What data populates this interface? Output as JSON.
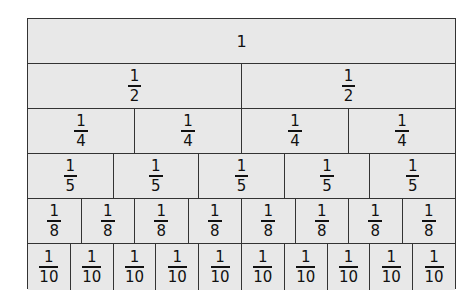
{
  "diagram": {
    "rows": [
      {
        "denominator": 1,
        "label": "1",
        "count": 1
      },
      {
        "denominator": 2,
        "numerator": "1",
        "den_label": "2",
        "count": 2
      },
      {
        "denominator": 4,
        "numerator": "1",
        "den_label": "4",
        "count": 4
      },
      {
        "denominator": 5,
        "numerator": "1",
        "den_label": "5",
        "count": 5
      },
      {
        "denominator": 8,
        "numerator": "1",
        "den_label": "8",
        "count": 8
      },
      {
        "denominator": 10,
        "numerator": "1",
        "den_label": "10",
        "count": 10
      }
    ],
    "colors": {
      "cell_fill": "#e8e8e8",
      "border": "#333333",
      "text": "#111111"
    }
  }
}
